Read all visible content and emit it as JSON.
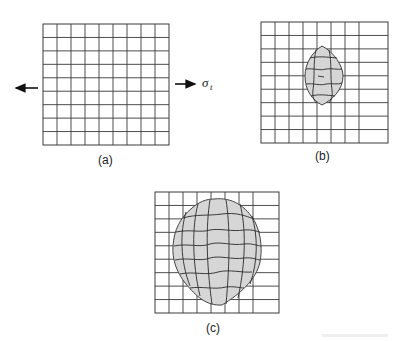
{
  "figure": {
    "panels": [
      {
        "id": "a",
        "label": "(a)",
        "columns": 9,
        "rows": 9,
        "damage": "none"
      },
      {
        "id": "b",
        "label": "(b)",
        "columns": 8,
        "rows": 9,
        "damage": "small lens-shaped zone"
      },
      {
        "id": "c",
        "label": "(c)",
        "columns": 8,
        "rows": 9,
        "damage": "large deformed zone"
      }
    ],
    "stress_symbol": "σ",
    "stress_subscript": "t",
    "colors": {
      "grid": "#3a3a3a",
      "zone_fill": "#d6d6d6",
      "ink": "#222222"
    }
  }
}
